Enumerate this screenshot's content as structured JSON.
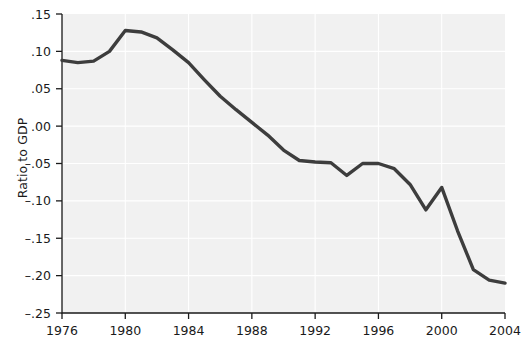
{
  "chart_data": {
    "type": "line",
    "title": "",
    "subtitle": "",
    "xlabel": "",
    "ylabel": "Ratio to GDP",
    "xlim": [
      1976,
      2004
    ],
    "ylim": [
      -0.25,
      0.15
    ],
    "xticks": [
      1976,
      1980,
      1984,
      1988,
      1992,
      1996,
      2000,
      2004
    ],
    "xtick_labels": [
      "1976",
      "1980",
      "1984",
      "1988",
      "1992",
      "1996",
      "2000",
      "2004"
    ],
    "yticks": [
      0.15,
      0.1,
      0.05,
      0.0,
      -0.05,
      -0.1,
      -0.15,
      -0.2,
      -0.25
    ],
    "ytick_labels": [
      ".15",
      ".10",
      ".05",
      ".00",
      "–.05",
      "–.10",
      "–.15",
      "–.20",
      "–.25"
    ],
    "grid": true,
    "grid_color": "#ffffff",
    "plot_bg": "#f1f1f1",
    "figure_bg": "#ffffff",
    "line_color": "#3d3d3d",
    "legend": [],
    "series": [
      {
        "name": "Ratio to GDP",
        "x": [
          1976,
          1977,
          1978,
          1979,
          1980,
          1981,
          1982,
          1983,
          1984,
          1985,
          1986,
          1987,
          1988,
          1989,
          1990,
          1991,
          1992,
          1993,
          1994,
          1995,
          1996,
          1997,
          1998,
          1999,
          2000,
          2001,
          2002,
          2003,
          2004
        ],
        "values": [
          0.088,
          0.085,
          0.087,
          0.1,
          0.128,
          0.126,
          0.118,
          0.102,
          0.085,
          0.062,
          0.04,
          0.022,
          0.005,
          -0.012,
          -0.032,
          -0.046,
          -0.048,
          -0.049,
          -0.066,
          -0.05,
          -0.05,
          -0.057,
          -0.078,
          -0.112,
          -0.082,
          -0.14,
          -0.192,
          -0.206,
          -0.21
        ]
      }
    ]
  },
  "axes": {
    "ylabel_text": "Ratio to GDP"
  }
}
